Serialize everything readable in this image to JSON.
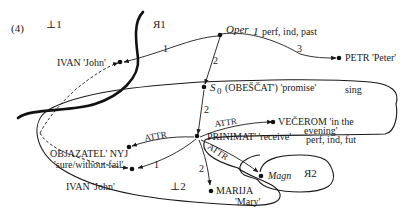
{
  "example_number": "(4)",
  "regions": {
    "L1": "⊥1",
    "R1": "Я1",
    "L2": "⊥2",
    "R2": "Я2"
  },
  "nodes": {
    "ivan_top": "IVAN 'John'",
    "oper_name": "Oper",
    "oper_index": "1",
    "oper_gram": "perf, ind, past",
    "petr": "PETR 'Peter'",
    "s0_symbol": "S",
    "s0_sub": "0",
    "s0_rest": "(OBEŠČAT') 'promise'",
    "s0_gram": "sing",
    "vecerom_line1": "VEČEROM 'in the",
    "vecerom_line2": "evening'",
    "prinimat": "PRINIMAT' 'receive'",
    "prinimat_gram": "perf, ind, fut",
    "objazatel_line1": "OBJAZATEL' NYJ",
    "objazatel_line2": "'sure/without fail'",
    "ivan_bottom": "IVAN 'John'",
    "marija_line1": "MARIJA",
    "marija_line2": "'Mary'",
    "magn": "Magn"
  },
  "edges": {
    "oper_ivan": "1",
    "oper_petr": "3",
    "oper_s0": "2",
    "s0_prinimat": "2",
    "prinimat_vecerom": "ATTR",
    "prinimat_objazatel": "ATTR",
    "prinimat_ivan": "1",
    "prinimat_marija": "2",
    "prinimat_magn": "ATTR"
  }
}
